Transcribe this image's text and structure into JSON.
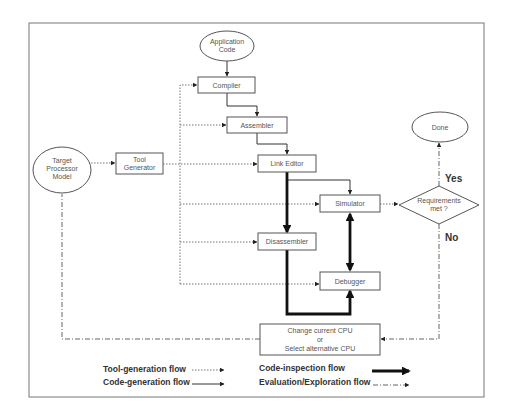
{
  "diagram": {
    "nodes": {
      "application_code": [
        "Application",
        "Code"
      ],
      "compiler": "Compiler",
      "assembler": "Assembler",
      "link_editor": "Link Editor",
      "simulator": "Simulator",
      "disassembler": "Disassembler",
      "debugger": "Debugger",
      "target_processor_model": [
        "Target",
        "Processor",
        "Model"
      ],
      "tool_generator": [
        "Tool",
        "Generator"
      ],
      "done": "Done",
      "requirements_met": [
        "Requirements",
        "met ?"
      ],
      "change_cpu": [
        "Change current CPU",
        "or",
        "Select alternative CPU"
      ]
    },
    "edge_labels": {
      "yes": "Yes",
      "no": "No"
    },
    "legend": {
      "tool_generation": "Tool-generation flow",
      "code_generation": "Code-generation flow",
      "code_inspection": "Code-inspection flow",
      "evaluation_exploration": "Evaluation/Exploration flow"
    },
    "colors": {
      "line": "#333333",
      "box_border": "#555555",
      "frame": "#777777"
    }
  }
}
